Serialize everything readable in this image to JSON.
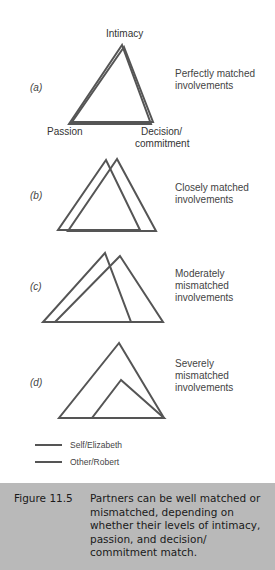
{
  "figure": {
    "vertex_labels": {
      "top": "Intimacy",
      "left": "Passion",
      "right_line1": "Decision/",
      "right_line2": "commitment"
    },
    "panels": [
      {
        "id": "(a)",
        "desc_lines": [
          "Perfectly matched",
          "involvements"
        ]
      },
      {
        "id": "(b)",
        "desc_lines": [
          "Closely matched",
          "involvements"
        ]
      },
      {
        "id": "(c)",
        "desc_lines": [
          "Moderately",
          "mismatched",
          "involvements"
        ]
      },
      {
        "id": "(d)",
        "desc_lines": [
          "Severely",
          "mismatched",
          "involvements"
        ]
      }
    ],
    "legend": [
      {
        "label": "Self/Elizabeth",
        "color": "#555555"
      },
      {
        "label": "Other/Robert",
        "color": "#555555"
      }
    ],
    "line_color": "#555555"
  },
  "caption": {
    "label": "Figure 11.5",
    "text": "Partners can be well matched or mismatched, depending on whether their levels of intimacy, passion, and decision/ commitment match.",
    "background": "#b9b9b9"
  }
}
